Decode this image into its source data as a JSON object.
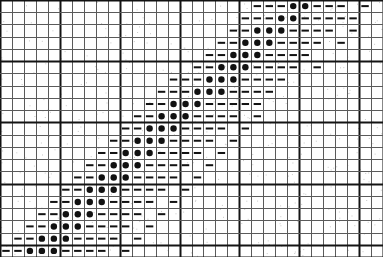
{
  "figure": {
    "title": "",
    "background_color": "#ffffff",
    "ink_color": "#111111",
    "minor_line_color": "#5a5a5a",
    "major_line_color": "#141414"
  },
  "chart_data": {
    "type": "heatmap",
    "title": "",
    "subtitle": "",
    "xlabel": "",
    "ylabel": "",
    "grid": true,
    "legend": null,
    "legend_position": "none",
    "columns": 32,
    "rows": 21,
    "cell_width_px": 11.97,
    "cell_height_px": 12.24,
    "xlim": [
      0,
      32
    ],
    "ylim": [
      0,
      21
    ],
    "x_tick_labels": [],
    "y_tick_labels": [],
    "major_gridline_column_interval": 5,
    "major_gridline_row_interval": 5,
    "symbols": {
      "0": "empty",
      "1": "dash",
      "2": "dot"
    },
    "symbol_counts": {
      "empty": 489,
      "dash": 134,
      "dot": 49
    },
    "matrix": [
      [
        0,
        0,
        0,
        0,
        0,
        0,
        0,
        0,
        0,
        0,
        0,
        0,
        0,
        0,
        0,
        0,
        0,
        0,
        0,
        0,
        0,
        1,
        1,
        1,
        2,
        2,
        1,
        1,
        1,
        0,
        1,
        0
      ],
      [
        0,
        0,
        0,
        0,
        0,
        0,
        0,
        0,
        0,
        0,
        0,
        0,
        0,
        0,
        0,
        0,
        0,
        0,
        0,
        0,
        1,
        1,
        1,
        2,
        2,
        1,
        1,
        1,
        1,
        1,
        0,
        0
      ],
      [
        0,
        0,
        0,
        0,
        0,
        0,
        0,
        0,
        0,
        0,
        0,
        0,
        0,
        0,
        0,
        0,
        0,
        0,
        0,
        1,
        1,
        2,
        2,
        2,
        1,
        1,
        1,
        1,
        0,
        1,
        0,
        0
      ],
      [
        0,
        0,
        0,
        0,
        0,
        0,
        0,
        0,
        0,
        0,
        0,
        0,
        0,
        0,
        0,
        0,
        0,
        0,
        1,
        1,
        2,
        2,
        2,
        1,
        1,
        1,
        1,
        0,
        1,
        0,
        0,
        0
      ],
      [
        0,
        0,
        0,
        0,
        0,
        0,
        0,
        0,
        0,
        0,
        0,
        0,
        0,
        0,
        0,
        0,
        0,
        1,
        1,
        2,
        2,
        2,
        1,
        1,
        1,
        1,
        0,
        0,
        0,
        0,
        0,
        0
      ],
      [
        0,
        0,
        0,
        0,
        0,
        0,
        0,
        0,
        0,
        0,
        0,
        0,
        0,
        0,
        0,
        0,
        1,
        1,
        2,
        2,
        2,
        1,
        1,
        1,
        1,
        0,
        1,
        0,
        0,
        0,
        0,
        0
      ],
      [
        0,
        0,
        0,
        0,
        0,
        0,
        0,
        0,
        0,
        0,
        0,
        0,
        0,
        0,
        1,
        1,
        1,
        2,
        2,
        2,
        1,
        1,
        1,
        1,
        0,
        0,
        0,
        0,
        0,
        0,
        0,
        0
      ],
      [
        0,
        0,
        0,
        0,
        0,
        0,
        0,
        0,
        0,
        0,
        0,
        0,
        0,
        1,
        1,
        1,
        2,
        2,
        2,
        1,
        1,
        1,
        1,
        0,
        0,
        0,
        0,
        0,
        0,
        0,
        0,
        0
      ],
      [
        0,
        0,
        0,
        0,
        0,
        0,
        0,
        0,
        0,
        0,
        0,
        0,
        1,
        1,
        2,
        2,
        2,
        1,
        1,
        1,
        1,
        1,
        0,
        0,
        0,
        0,
        0,
        0,
        0,
        0,
        0,
        0
      ],
      [
        0,
        0,
        0,
        0,
        0,
        0,
        0,
        0,
        0,
        0,
        0,
        1,
        1,
        2,
        2,
        2,
        1,
        1,
        1,
        1,
        0,
        1,
        0,
        0,
        0,
        0,
        0,
        0,
        0,
        0,
        0,
        0
      ],
      [
        0,
        0,
        0,
        0,
        0,
        0,
        0,
        0,
        0,
        0,
        1,
        1,
        2,
        2,
        2,
        1,
        1,
        1,
        1,
        0,
        1,
        0,
        0,
        0,
        0,
        0,
        0,
        0,
        0,
        0,
        0,
        0
      ],
      [
        0,
        0,
        0,
        0,
        0,
        0,
        0,
        0,
        0,
        1,
        1,
        2,
        2,
        2,
        1,
        1,
        1,
        1,
        0,
        1,
        0,
        0,
        0,
        0,
        0,
        0,
        0,
        0,
        0,
        0,
        0,
        0
      ],
      [
        0,
        0,
        0,
        0,
        0,
        0,
        0,
        0,
        1,
        1,
        2,
        2,
        2,
        1,
        1,
        1,
        1,
        0,
        1,
        0,
        0,
        0,
        0,
        0,
        0,
        0,
        0,
        0,
        0,
        0,
        0,
        0
      ],
      [
        0,
        0,
        0,
        0,
        0,
        0,
        0,
        1,
        1,
        2,
        2,
        2,
        1,
        1,
        1,
        1,
        0,
        1,
        0,
        0,
        0,
        0,
        0,
        0,
        0,
        0,
        0,
        0,
        0,
        0,
        0,
        0
      ],
      [
        0,
        0,
        0,
        0,
        0,
        0,
        1,
        1,
        2,
        2,
        2,
        1,
        1,
        1,
        1,
        0,
        1,
        0,
        0,
        0,
        0,
        0,
        0,
        0,
        0,
        0,
        0,
        0,
        0,
        0,
        0,
        0
      ],
      [
        0,
        0,
        0,
        0,
        0,
        1,
        1,
        2,
        2,
        2,
        1,
        1,
        1,
        1,
        0,
        1,
        0,
        0,
        0,
        0,
        0,
        0,
        0,
        0,
        0,
        0,
        0,
        0,
        0,
        0,
        0,
        0
      ],
      [
        0,
        0,
        0,
        0,
        1,
        1,
        2,
        2,
        2,
        1,
        1,
        1,
        1,
        0,
        1,
        0,
        0,
        0,
        0,
        0,
        0,
        0,
        0,
        0,
        0,
        0,
        0,
        0,
        0,
        0,
        0,
        0
      ],
      [
        0,
        0,
        0,
        1,
        1,
        2,
        2,
        2,
        1,
        1,
        1,
        1,
        0,
        1,
        0,
        0,
        0,
        0,
        0,
        0,
        0,
        0,
        0,
        0,
        0,
        0,
        0,
        0,
        0,
        0,
        0,
        0
      ],
      [
        0,
        0,
        1,
        1,
        2,
        2,
        2,
        1,
        1,
        1,
        1,
        0,
        1,
        0,
        0,
        0,
        0,
        0,
        0,
        0,
        0,
        0,
        0,
        0,
        0,
        0,
        0,
        0,
        0,
        0,
        0,
        0
      ],
      [
        0,
        1,
        1,
        2,
        2,
        2,
        1,
        1,
        1,
        1,
        0,
        1,
        0,
        0,
        0,
        0,
        0,
        0,
        0,
        0,
        0,
        0,
        0,
        0,
        0,
        0,
        0,
        0,
        0,
        0,
        0,
        0
      ],
      [
        1,
        1,
        2,
        2,
        2,
        1,
        1,
        1,
        1,
        0,
        1,
        0,
        0,
        0,
        0,
        0,
        0,
        0,
        0,
        0,
        0,
        0,
        0,
        0,
        0,
        0,
        0,
        0,
        0,
        0,
        0,
        0
      ]
    ]
  }
}
